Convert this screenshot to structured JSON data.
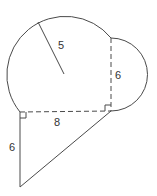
{
  "diagram": {
    "colors": {
      "stroke": "#4a4a4a",
      "text": "#333333",
      "background": "#ffffff"
    },
    "labels": {
      "radius": "5",
      "semicircle_diameter": "6",
      "horizontal_chord": "8",
      "triangle_leg": "6"
    },
    "shapes": [
      {
        "type": "circle-arc",
        "radius_label": "5"
      },
      {
        "type": "semicircle",
        "diameter_label": "6"
      },
      {
        "type": "dashed-segment",
        "orientation": "horizontal",
        "length_label": "8"
      },
      {
        "type": "dashed-segment",
        "orientation": "vertical",
        "length_label": "6"
      },
      {
        "type": "right-triangle",
        "leg_labels": [
          "6",
          "8"
        ]
      }
    ],
    "right_angle_markers": 2
  }
}
